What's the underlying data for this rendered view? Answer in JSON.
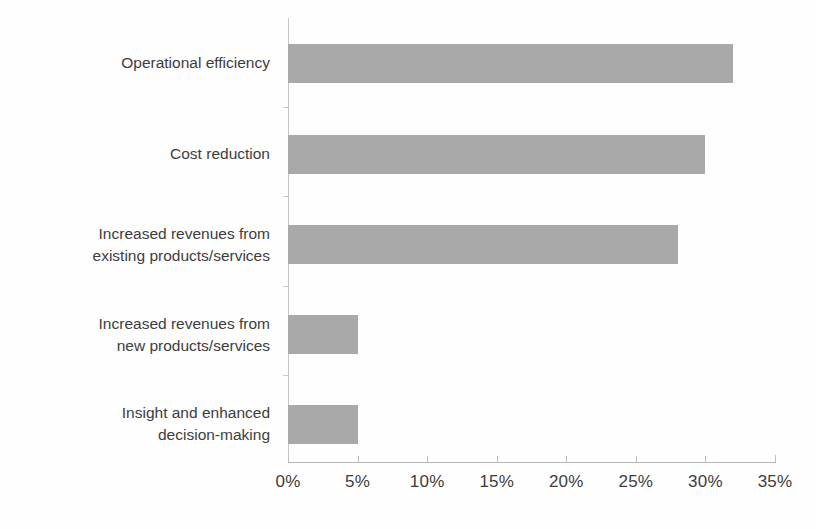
{
  "chart_data": {
    "type": "bar",
    "orientation": "horizontal",
    "title": "",
    "subtitle": "",
    "xlabel": "",
    "ylabel": "",
    "categories": [
      "Operational efficiency",
      "Cost reduction",
      "Increased revenues from existing products/services",
      "Increased revenues from new products/services",
      "Insight and enhanced decision-making"
    ],
    "values": [
      32,
      30,
      28,
      5,
      5
    ],
    "value_labels": [
      "32%",
      "30%",
      "28%",
      "5%",
      "5%"
    ],
    "xlim": [
      0,
      35
    ],
    "xticks": [
      0,
      5,
      10,
      15,
      20,
      25,
      30,
      35
    ],
    "xtick_labels": [
      "0%",
      "5%",
      "10%",
      "15%",
      "20%",
      "25%",
      "30%",
      "35%"
    ],
    "grid": false,
    "legend": null,
    "bar_color": "#a9a9a9",
    "axis_color": "#bdbdbd",
    "text_color": "#3d3d3d",
    "background": "#ffffff"
  },
  "axis": {
    "x_ticks": [
      {
        "label": "0%",
        "value": 0
      },
      {
        "label": "5%",
        "value": 5
      },
      {
        "label": "10%",
        "value": 10
      },
      {
        "label": "15%",
        "value": 15
      },
      {
        "label": "20%",
        "value": 20
      },
      {
        "label": "25%",
        "value": 25
      },
      {
        "label": "30%",
        "value": 30
      },
      {
        "label": "35%",
        "value": 35
      }
    ]
  },
  "categories": [
    {
      "line1": "Operational efficiency",
      "line2": ""
    },
    {
      "line1": "Cost reduction",
      "line2": ""
    },
    {
      "line1": "Increased revenues from",
      "line2": "existing products/services"
    },
    {
      "line1": "Increased revenues from",
      "line2": "new products/services"
    },
    {
      "line1": "Insight and enhanced",
      "line2": "decision-making"
    }
  ]
}
